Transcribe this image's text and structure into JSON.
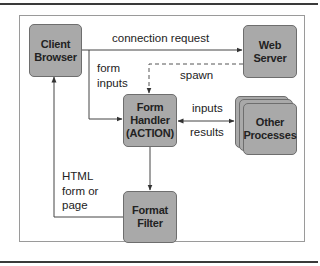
{
  "diagram": {
    "nodes": {
      "client_browser": "Client\nBrowser",
      "web_server": "Web\nServer",
      "form_handler": "Form\nHandler\n(ACTION)",
      "other_processes": "Other\nProcesses",
      "format_filter": "Format\nFilter"
    },
    "edges": {
      "connection_request": "connection request",
      "form_inputs": "form\ninputs",
      "spawn": "spawn",
      "inputs": "inputs",
      "results": "results",
      "html_form_or_page": "HTML\nform or\npage"
    },
    "colors": {
      "box_fill": "#a9a9a9",
      "box_border": "#6e6e6e",
      "line": "#444444",
      "frame": "#9a9a9a",
      "rule": "#3a3a3a"
    }
  }
}
